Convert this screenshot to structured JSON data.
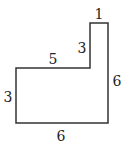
{
  "diagram": {
    "shape": "L-shaped polygon",
    "stroke_color": "#333333",
    "labels": {
      "top": "1",
      "inner_vertical": "3",
      "inner_horizontal": "5",
      "right": "6",
      "left": "3",
      "bottom": "6"
    }
  }
}
